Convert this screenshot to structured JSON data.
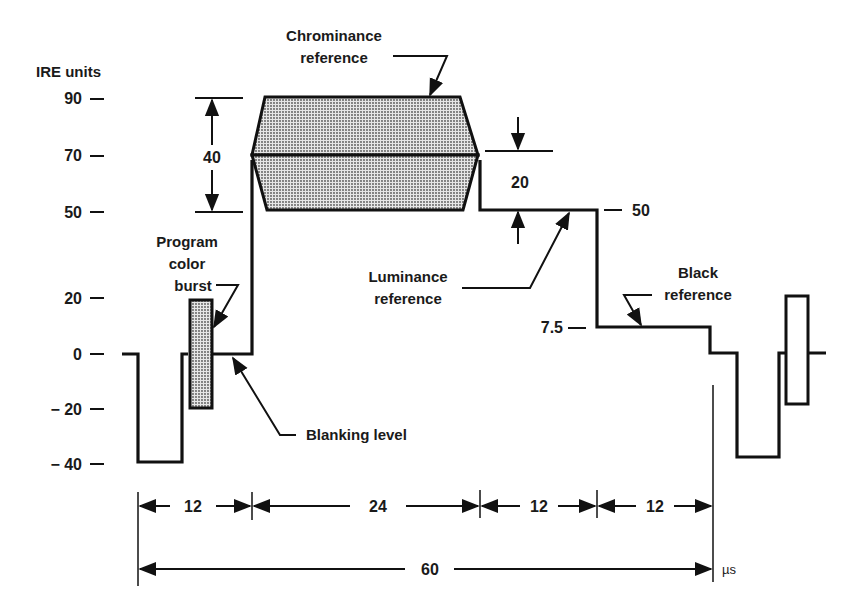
{
  "axis": {
    "label": "IRE units",
    "ticks": [
      "90",
      "70",
      "50",
      "20",
      "0",
      "− 20",
      "− 40"
    ],
    "right_ticks": [
      "50",
      "7.5"
    ]
  },
  "annotations": {
    "chrominance_line1": "Chrominance",
    "chrominance_line2": "reference",
    "luminance_line1": "Luminance",
    "luminance_line2": "reference",
    "black_line1": "Black",
    "black_line2": "reference",
    "burst_line1": "Program",
    "burst_line2": "color",
    "burst_line3": "burst",
    "blanking": "Blanking level",
    "dim_40": "40",
    "dim_20": "20"
  },
  "timing": {
    "segments": [
      "12",
      "24",
      "12",
      "12"
    ],
    "total": "60",
    "unit": "µs"
  },
  "levels_ire": {
    "chrominance_peak": 90,
    "luminance_reference": 70,
    "chrominance_trough": 50,
    "luminance_step": 50,
    "black_reference": 7.5,
    "blanking": 0,
    "sync_tip": -40,
    "burst_top": 20,
    "burst_bottom": -20
  }
}
